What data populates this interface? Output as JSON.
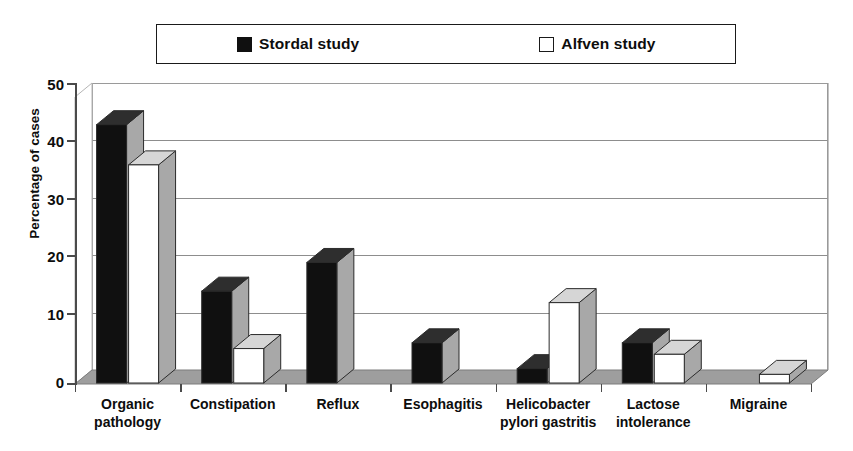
{
  "chart_data": {
    "type": "bar",
    "title": "",
    "xlabel": "",
    "ylabel": "Percentage of cases",
    "ylim": [
      0,
      50
    ],
    "yticks": [
      0,
      10,
      20,
      30,
      40,
      50
    ],
    "grid": true,
    "legend_position": "top",
    "style": "3d-column",
    "categories": [
      "Organic pathology",
      "Constipation",
      "Reflux",
      "Esophagitis",
      "Helicobacter pylori gastritis",
      "Lactose intolerance",
      "Migraine"
    ],
    "category_lines": [
      [
        "Organic",
        "pathology"
      ],
      [
        "Constipation"
      ],
      [
        "Reflux"
      ],
      [
        "Esophagitis"
      ],
      [
        "Helicobacter",
        "pylori gastritis"
      ],
      [
        "Lactose",
        "intolerance"
      ],
      [
        "Migraine"
      ]
    ],
    "series": [
      {
        "name": "Stordal study",
        "color": "#101010",
        "marker": "filled-square",
        "values": [
          45,
          16,
          21,
          7,
          2.5,
          7,
          0
        ]
      },
      {
        "name": "Alfven study",
        "color": "#ffffff",
        "marker": "open-square",
        "values": [
          38,
          6,
          0,
          0,
          14,
          5,
          1.5
        ]
      }
    ]
  },
  "legend": {
    "entries": [
      {
        "label": "Stordal study",
        "marker": "filled-square-icon"
      },
      {
        "label": "Alfven study",
        "marker": "open-square-icon"
      }
    ]
  },
  "axes": {
    "y_title": "Percentage of cases",
    "y_tick_labels": [
      "50",
      "40",
      "30",
      "20",
      "10",
      "0"
    ]
  },
  "colors": {
    "series_filled": "#101010",
    "series_open": "#ffffff",
    "bar_outline": "#2b2b2b",
    "side_shade": "#a8a8a8",
    "top_shade": "#d6d6d6",
    "gridline": "#8d8d8d",
    "axis": "#4a4a4a",
    "floor": "#9e9e9e",
    "background": "#ffffff"
  }
}
